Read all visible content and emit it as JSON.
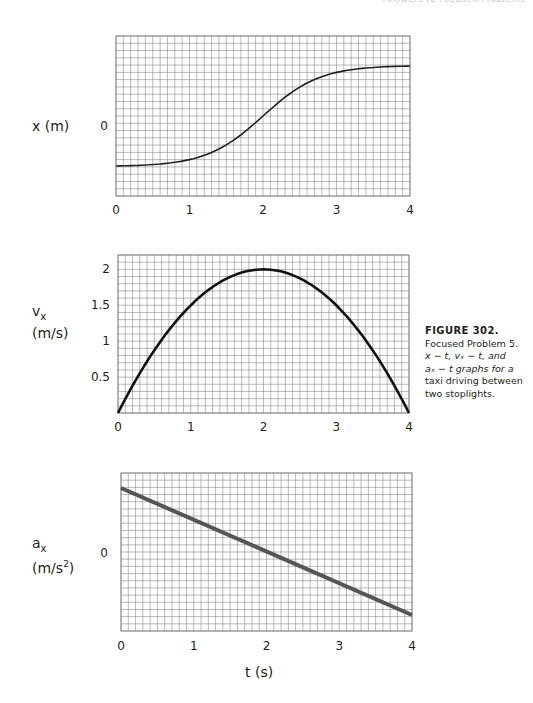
{
  "header": {
    "running_head": "Answers to Focused Problems"
  },
  "figure": {
    "number_label": "FIGURE 302.",
    "caption_line1": "Focused Problem 5.",
    "caption_line2": "x − t, vₓ − t, and",
    "caption_line3": "aₓ − t graphs for a",
    "caption_line4": "taxi driving between",
    "caption_line5": "two stoplights."
  },
  "shared_xlabel": "t (s)",
  "chart_data": [
    {
      "type": "line",
      "title": "x-t graph",
      "xlabel": "t (s)",
      "ylabel": "x (m)",
      "xlim": [
        0,
        4
      ],
      "xticks": [
        "0",
        "1",
        "2",
        "3",
        "4"
      ],
      "yticks": [
        "0"
      ],
      "grid": true,
      "x": [
        0,
        0.5,
        1,
        1.5,
        2,
        2.5,
        3,
        3.5,
        4
      ],
      "y_grid_units": [
        -3.9,
        -3.8,
        -3.3,
        -2.1,
        -0.3,
        1.7,
        2.8,
        3.2,
        3.3
      ],
      "note": "S-shaped curve; y in grid-row units relative to 0 line"
    },
    {
      "type": "line",
      "title": "vx-t graph",
      "xlabel": "t (s)",
      "ylabel": "vx (m/s)",
      "xlim": [
        0,
        4
      ],
      "ylim": [
        0,
        2.2
      ],
      "xticks": [
        "0",
        "1",
        "2",
        "3",
        "4"
      ],
      "yticks": [
        "0.5",
        "1",
        "1.5",
        "2"
      ],
      "grid": true,
      "x": [
        0,
        0.5,
        1,
        1.5,
        2,
        2.5,
        3,
        3.5,
        4
      ],
      "y": [
        0,
        0.875,
        1.5,
        1.875,
        2.0,
        1.875,
        1.5,
        0.875,
        0
      ]
    },
    {
      "type": "line",
      "title": "ax-t graph",
      "xlabel": "t (s)",
      "ylabel": "ax (m/s²)",
      "xlim": [
        0,
        4
      ],
      "xticks": [
        "0",
        "1",
        "2",
        "3",
        "4"
      ],
      "yticks": [
        "0"
      ],
      "grid": true,
      "x": [
        0,
        4
      ],
      "y_grid_units": [
        8.5,
        -9
      ],
      "note": "straight decreasing line crossing 0 at t=2"
    }
  ],
  "labels": {
    "x_axis_label": "x (m)",
    "v_label_main": "v",
    "v_label_sub": "x",
    "v_units": "(m/s)",
    "a_label_main": "a",
    "a_label_sub": "x",
    "a_units_pre": "(m/s",
    "a_units_sup": "2",
    "a_units_post": ")",
    "zero": "0",
    "ticks_t": [
      "0",
      "1",
      "2",
      "3",
      "4"
    ],
    "ticks_v": [
      "2",
      "1.5",
      "1",
      "0.5"
    ]
  }
}
